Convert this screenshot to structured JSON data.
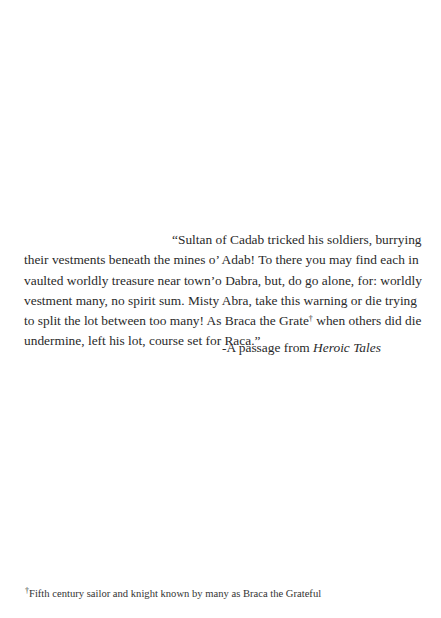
{
  "passage": {
    "lines": [
      "“Sultan of Cadab tricked his soldiers, burrying",
      "their vestments beneath the mines o’ Adab! To there you may find each in",
      "vaulted worldly treasure  near town’o Dabra, but, do go alone, for: worldly",
      "vestment many, no spirit sum.  Misty Abra, take this warning or die trying",
      "to split the lot between too many! As Braca the Grate",
      " when others did die",
      "undermine, left his lot, course set for Raca.”"
    ],
    "footnote_mark": "†"
  },
  "attribution": {
    "prefix": "-A passage from ",
    "title": "Heroic Tales"
  },
  "footnote": {
    "mark": "†",
    "text": "Fifth century sailor and knight known by many as Braca the Grateful"
  }
}
